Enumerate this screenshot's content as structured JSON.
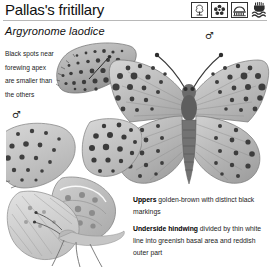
{
  "page": {
    "title": "Pallas's fritillary",
    "scientific_name": "Argyronome laodice"
  },
  "header_icons": [
    {
      "name": "tree-habitat-icon",
      "label": "tree"
    },
    {
      "name": "flower-habitat-icon",
      "label": "flower"
    },
    {
      "name": "bridge-habitat-icon",
      "label": "bridge"
    },
    {
      "name": "hand-water-habitat-icon",
      "label": "hand over water"
    }
  ],
  "annotations": {
    "left_note": {
      "lines": [
        "Black spots near",
        "forewing apex",
        "are smaller than",
        "the others"
      ]
    }
  },
  "sex_symbols": {
    "upper": "♂",
    "lower": "♂"
  },
  "descriptions": [
    {
      "lead": "Uppers",
      "text": " golden-brown with distinct black markings"
    },
    {
      "lead": "Underside hindwing",
      "text": " divided by thin white line into greenish basal area and reddish outer part"
    }
  ],
  "specimens": [
    {
      "name": "forewing-apex-detail",
      "view": "forewing apex detail"
    },
    {
      "name": "spread-wing-male-specimen",
      "view": "upperside, wings spread"
    },
    {
      "name": "underside-male-specimen",
      "view": "underside, side view"
    }
  ],
  "colors": {
    "rule": "#b8b8b8",
    "text": "#1c1c1c",
    "title": "#111111",
    "specimen_light": "#d9d9d9",
    "specimen_mid": "#a8a8a8",
    "specimen_dark": "#4a4a4a"
  }
}
